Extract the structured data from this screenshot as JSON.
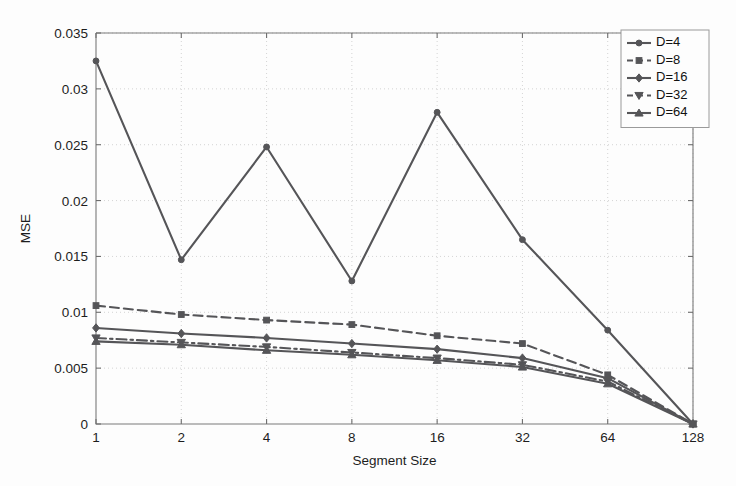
{
  "chart_data": {
    "type": "line",
    "title": "",
    "xlabel": "Segment Size",
    "ylabel": "MSE",
    "x": [
      1,
      2,
      4,
      8,
      16,
      32,
      64,
      128
    ],
    "xticklabels": [
      "1",
      "2",
      "4",
      "8",
      "16",
      "32",
      "64",
      "128"
    ],
    "xscale": "log2",
    "xlim": [
      1,
      128
    ],
    "ylim": [
      0,
      0.035
    ],
    "yticks": [
      0,
      0.005,
      0.01,
      0.015,
      0.02,
      0.025,
      0.03,
      0.035
    ],
    "yticklabels": [
      "0",
      "0.005",
      "0.01",
      "0.015",
      "0.02",
      "0.025",
      "0.03",
      "0.035"
    ],
    "grid": true,
    "legend_position": "top-right",
    "line_color": "#555558",
    "series": [
      {
        "name": "D=4",
        "legend_label": "D=4",
        "marker": "circle",
        "linestyle": "solid",
        "values": [
          0.0325,
          0.0147,
          0.0248,
          0.0128,
          0.0279,
          0.0165,
          0.0084,
          0.0
        ]
      },
      {
        "name": "D=8",
        "legend_label": "D=8",
        "marker": "square",
        "linestyle": "dashed",
        "values": [
          0.0106,
          0.0098,
          0.0093,
          0.0089,
          0.0079,
          0.0072,
          0.0044,
          0.0
        ]
      },
      {
        "name": "D=16",
        "legend_label": "D=16",
        "marker": "diamond",
        "linestyle": "solid",
        "values": [
          0.0086,
          0.0081,
          0.0077,
          0.0072,
          0.0067,
          0.0059,
          0.0041,
          0.0
        ]
      },
      {
        "name": "D=32",
        "legend_label": "D=32",
        "marker": "triangle-down",
        "linestyle": "dashdot",
        "values": [
          0.0077,
          0.0073,
          0.0069,
          0.0064,
          0.0059,
          0.0053,
          0.0038,
          0.0
        ]
      },
      {
        "name": "D=64",
        "legend_label": "D=64",
        "marker": "triangle-up",
        "linestyle": "solid",
        "values": [
          0.0074,
          0.0071,
          0.0066,
          0.0062,
          0.0057,
          0.0051,
          0.0036,
          0.0
        ]
      }
    ]
  }
}
